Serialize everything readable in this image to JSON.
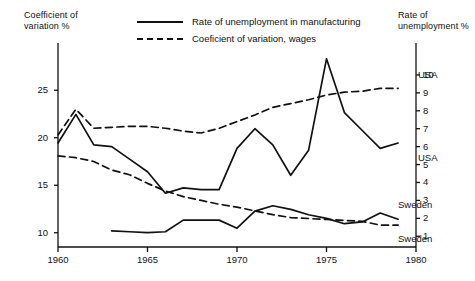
{
  "axes": {
    "left_title": "Coefficient of\nvariation %",
    "right_title": "Rate of\nunemployment %",
    "left_ticks": [
      10,
      15,
      20,
      25
    ],
    "right_ticks": [
      1,
      2,
      3,
      4,
      5,
      6,
      7,
      8,
      9,
      10
    ],
    "x_ticks": [
      1960,
      1965,
      1970,
      1975,
      1980
    ],
    "left_range": [
      8.5,
      28.5
    ],
    "right_range": [
      0.4,
      11.0
    ],
    "x_range": [
      1960,
      1980
    ],
    "grid": false
  },
  "legend": {
    "position": "top-center",
    "items": [
      {
        "label": "Rate of unemployment in manufacturing",
        "style": "solid",
        "icon": "solid-line-swatch"
      },
      {
        "label": "Coeficient of variation, wages",
        "style": "dashed",
        "icon": "dashed-line-swatch"
      }
    ]
  },
  "series_labels": [
    {
      "text": "USA",
      "name": "usa-dashed-label",
      "x": 418,
      "y": 69
    },
    {
      "text": "USA",
      "name": "usa-solid-label",
      "x": 418,
      "y": 152
    },
    {
      "text": "Sweden",
      "name": "sweden-solid-label",
      "x": 398,
      "y": 199
    },
    {
      "text": "Sweden",
      "name": "sweden-dashed-label",
      "x": 398,
      "y": 233
    }
  ],
  "colors": {
    "ink": "#111111",
    "background": "#ffffff"
  },
  "chart_data": {
    "type": "line",
    "title": "",
    "xlabel": "",
    "ylabel": "Coefficient of variation %",
    "y2label": "Rate of unemployment %",
    "xlim": [
      1960,
      1980
    ],
    "ylim": [
      8.5,
      28.5
    ],
    "y2lim": [
      0.4,
      11.0
    ],
    "grid": false,
    "legend_position": "top-center",
    "series": [
      {
        "name": "Coeficient of variation, wages - USA",
        "label": "USA",
        "style": "dashed",
        "axis": "left",
        "x": [
          1960,
          1961,
          1962,
          1963,
          1964,
          1965,
          1966,
          1967,
          1968,
          1969,
          1970,
          1971,
          1972,
          1973,
          1974,
          1975,
          1976,
          1977,
          1978,
          1979
        ],
        "values": [
          20.3,
          23.0,
          21.0,
          21.1,
          21.2,
          21.2,
          21.0,
          20.7,
          20.5,
          21.0,
          21.7,
          22.4,
          23.2,
          23.6,
          24.0,
          24.5,
          24.8,
          24.9,
          25.2,
          25.2
        ]
      },
      {
        "name": "Rate of unemployment in manufacturing - USA",
        "label": "USA",
        "style": "solid",
        "axis": "right",
        "x": [
          1960,
          1961,
          1962,
          1963,
          1964,
          1965,
          1966,
          1967,
          1968,
          1969,
          1970,
          1971,
          1972,
          1973,
          1974,
          1975,
          1976,
          1977,
          1978,
          1979
        ],
        "values": [
          6.2,
          7.8,
          6.1,
          6.0,
          5.3,
          4.6,
          3.4,
          3.7,
          3.6,
          3.6,
          5.9,
          7.0,
          6.1,
          4.4,
          5.8,
          10.9,
          7.9,
          6.9,
          5.9,
          6.2
        ]
      },
      {
        "name": "Coeficient of variation, wages - Sweden",
        "label": "Sweden",
        "style": "dashed",
        "axis": "left",
        "x": [
          1960,
          1961,
          1962,
          1963,
          1964,
          1965,
          1966,
          1967,
          1968,
          1969,
          1970,
          1971,
          1972,
          1973,
          1974,
          1975,
          1976,
          1977,
          1978,
          1979
        ],
        "values": [
          18.1,
          17.9,
          17.5,
          16.6,
          16.1,
          15.2,
          14.4,
          13.8,
          13.4,
          13.0,
          12.7,
          12.3,
          11.9,
          11.6,
          11.5,
          11.4,
          11.3,
          11.2,
          10.8,
          10.8
        ]
      },
      {
        "name": "Rate of unemployment in manufacturing - Sweden",
        "label": "Sweden",
        "style": "solid",
        "axis": "right",
        "x": [
          1963,
          1964,
          1965,
          1966,
          1967,
          1968,
          1969,
          1970,
          1971,
          1972,
          1973,
          1974,
          1975,
          1976,
          1977,
          1978,
          1979
        ],
        "values": [
          1.3,
          1.25,
          1.2,
          1.25,
          1.9,
          1.9,
          1.9,
          1.45,
          2.4,
          2.7,
          2.5,
          2.2,
          2.0,
          1.7,
          1.8,
          2.3,
          1.95
        ]
      }
    ]
  }
}
